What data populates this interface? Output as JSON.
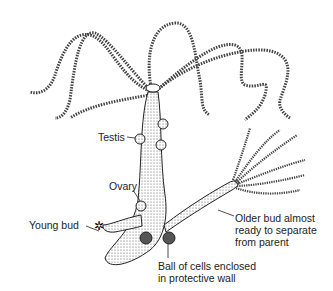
{
  "diagram": {
    "labels": {
      "testis": "Testis",
      "ovary": "Ovary",
      "young_bud": "Young bud",
      "older_bud_1": "Older bud almost",
      "older_bud_2": "ready to separate",
      "older_bud_3": "from parent",
      "ball_1": "Ball of cells enclosed",
      "ball_2": "in protective wall"
    }
  }
}
